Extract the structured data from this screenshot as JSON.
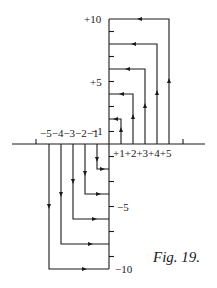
{
  "figure": {
    "caption": "Fig. 19.",
    "y_labels": {
      "p10": "+10",
      "p5": "+5",
      "m1": "−1",
      "m5": "−5",
      "m10": "−10"
    },
    "x_labels_negative": "−5−4−3−2−1",
    "x_labels_positive": "+1+2+3+4+5",
    "colors": {
      "ink": "#1a1a1a",
      "background": "#ffffff"
    }
  },
  "diagram": {
    "positive_paths": [
      {
        "x": 1,
        "to_y": 2
      },
      {
        "x": 2,
        "to_y": 4
      },
      {
        "x": 3,
        "to_y": 6
      },
      {
        "x": 4,
        "to_y": 8
      },
      {
        "x": 5,
        "to_y": 10
      }
    ],
    "negative_paths": [
      {
        "x": -1,
        "to_y": -2
      },
      {
        "x": -2,
        "to_y": -4
      },
      {
        "x": -3,
        "to_y": -6
      },
      {
        "x": -4,
        "to_y": -8
      },
      {
        "x": -5,
        "to_y": -10
      }
    ],
    "y_range": [
      -10,
      10
    ],
    "x_range": [
      -6,
      6
    ]
  }
}
